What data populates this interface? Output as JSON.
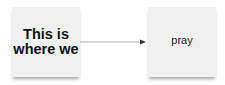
{
  "nodes": [
    {
      "id": "left",
      "label": "This is where we",
      "style": "bold"
    },
    {
      "id": "right",
      "label": "pray",
      "style": "plain"
    }
  ],
  "edges": [
    {
      "from": "left",
      "to": "right",
      "arrow": "filled-triangle"
    }
  ],
  "colors": {
    "card": "#f0f0f0",
    "line": "#999999",
    "arrowhead": "#333333"
  }
}
